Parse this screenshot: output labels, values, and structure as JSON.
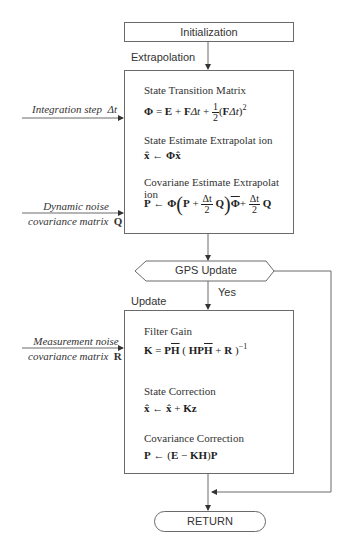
{
  "flowchart": {
    "initialization": {
      "label": "Initialization"
    },
    "extrapolation": {
      "section_label": "Extrapolation",
      "blocks": [
        {
          "title": "State Transition Matrix",
          "equation": "Φ = E + FΔt + ½(FΔt)²"
        },
        {
          "title": "State Estimate Extrapolat ion",
          "equation": "x̂ ← Φx̂"
        },
        {
          "title": "Covariane Estimate Extrapolat ion",
          "equation": "P ← Φ(P + Δt/2 Q)Φ̄ + Δt/2 Q"
        }
      ]
    },
    "inputs": {
      "integration_step": {
        "text": "Integration step",
        "symbol": "Δt"
      },
      "dynamic_noise": {
        "line1": "Dynamic noise",
        "line2": "covariance matrix",
        "symbol": "Q"
      },
      "measurement_noise": {
        "line1": "Measurement noise",
        "line2": "covariance matrix",
        "symbol": "R"
      }
    },
    "decision": {
      "label": "GPS Update",
      "yes_label": "Yes"
    },
    "update": {
      "section_label": "Update",
      "blocks": [
        {
          "title": "Filter Gain",
          "equation": "K = PH̄(HPH̄ + R)⁻¹"
        },
        {
          "title": "State Correction",
          "equation": "x̂ ← x̂ + Kz"
        },
        {
          "title": "Covariance Correction",
          "equation": "P ← (E − KH)P"
        }
      ]
    },
    "terminal": {
      "label": "RETURN"
    }
  },
  "eq_parts": {
    "phi": "Φ",
    "E": "E",
    "F": "F",
    "dt": "Δt",
    "one": "1",
    "two": "2",
    "sq": "2",
    "xhat": "x̂",
    "P": "P",
    "Q": "Q",
    "K": "K",
    "H": "H",
    "R": "R",
    "Kz": "Kz",
    "inv": "−1",
    "arrow": "←",
    "eq": "=",
    "plus": "+",
    "minus": "−"
  },
  "colors": {
    "line": "#6a6a6a",
    "text": "#333333",
    "background": "#ffffff"
  }
}
